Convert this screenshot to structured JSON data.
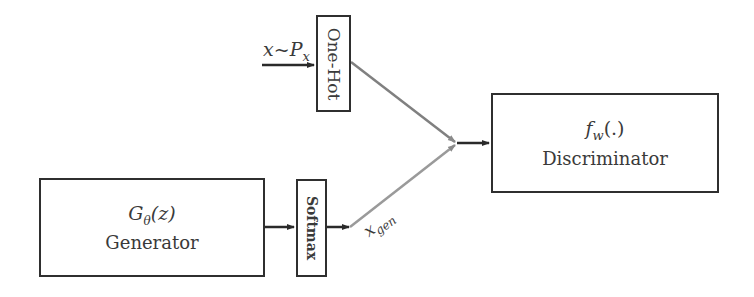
{
  "diagram": {
    "type": "block-diagram",
    "input": {
      "label_var": "x",
      "label_op": "~",
      "label_dist": "P",
      "label_dist_sub": "x"
    },
    "one_hot": {
      "label": "One-Hot"
    },
    "generator": {
      "math": "G",
      "math_sub": "θ",
      "math_arg": "(z)",
      "label": "Generator"
    },
    "softmax": {
      "label": "Softmax"
    },
    "gen_output": {
      "label": "x",
      "label_sub": "gen"
    },
    "discriminator": {
      "math": "f",
      "math_sub": "w",
      "math_arg": "(.)",
      "label": "Discriminator"
    },
    "colors": {
      "box_border": "#2f2f2f",
      "arrow_dark": "#2a2a2a",
      "arrow_gray": "#8a8a8a",
      "text": "#3a3a3a"
    }
  }
}
